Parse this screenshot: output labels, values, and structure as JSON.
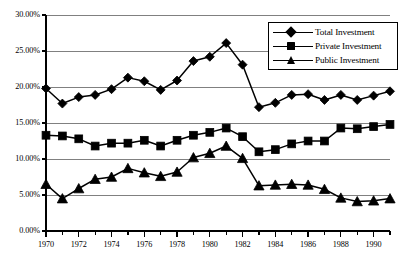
{
  "chart_data": {
    "type": "line",
    "title": "",
    "subtitle": "",
    "xlabel": "",
    "ylabel": "",
    "xlim": [
      1970,
      1991
    ],
    "ylim": [
      0,
      30
    ],
    "ytick_format": "percent",
    "grid": true,
    "legend_position": "top-right",
    "x": [
      1970,
      1971,
      1972,
      1973,
      1974,
      1975,
      1976,
      1977,
      1978,
      1979,
      1980,
      1981,
      1982,
      1983,
      1984,
      1985,
      1986,
      1987,
      1988,
      1989,
      1990,
      1991
    ],
    "ytick_labels": [
      "0.00%",
      "5.00%",
      "10.00%",
      "15.00%",
      "20.00%",
      "25.00%",
      "30.00%"
    ],
    "ytick_values": [
      0,
      5,
      10,
      15,
      20,
      25,
      30
    ],
    "xtick_labels": [
      "1970",
      "1972",
      "1974",
      "1976",
      "1978",
      "1980",
      "1982",
      "1984",
      "1986",
      "1988",
      "1990"
    ],
    "xtick_values": [
      1970,
      1972,
      1974,
      1976,
      1978,
      1980,
      1982,
      1984,
      1986,
      1988,
      1990
    ],
    "series": [
      {
        "name": "Total Investment",
        "marker": "diamond",
        "color": "#000000",
        "values": [
          19.8,
          17.7,
          18.6,
          18.9,
          19.7,
          21.3,
          20.8,
          19.6,
          20.9,
          23.6,
          24.2,
          26.1,
          23.1,
          17.2,
          17.8,
          18.9,
          19.0,
          18.2,
          18.9,
          18.2,
          18.8,
          19.4
        ]
      },
      {
        "name": "Private Investment",
        "marker": "square",
        "color": "#000000",
        "values": [
          13.3,
          13.2,
          12.8,
          11.8,
          12.2,
          12.2,
          12.6,
          11.8,
          12.6,
          13.3,
          13.7,
          14.3,
          13.1,
          11.0,
          11.3,
          12.1,
          12.5,
          12.5,
          14.3,
          14.2,
          14.5,
          14.8
        ]
      },
      {
        "name": "Public Investment",
        "marker": "triangle",
        "color": "#000000",
        "values": [
          6.5,
          4.5,
          5.9,
          7.2,
          7.5,
          8.7,
          8.1,
          7.6,
          8.2,
          10.2,
          10.8,
          11.8,
          10.1,
          6.3,
          6.4,
          6.5,
          6.4,
          5.8,
          4.6,
          4.1,
          4.2,
          4.5
        ]
      }
    ]
  },
  "legend": {
    "entries": [
      {
        "label": "Total Investment",
        "marker": "diamond"
      },
      {
        "label": "Private Investment",
        "marker": "square"
      },
      {
        "label": "Public Investment",
        "marker": "triangle"
      }
    ]
  }
}
